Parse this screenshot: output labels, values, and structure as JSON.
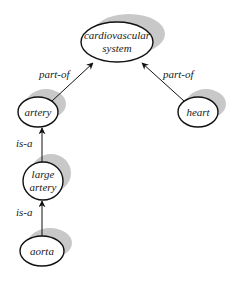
{
  "diagram": {
    "type": "concept-graph",
    "colors": {
      "stroke": "#111111",
      "shadow": "#c8c8c8",
      "fill": "#ffffff",
      "text": "#1a1a1a"
    },
    "nodes": [
      {
        "id": "cardiovascular-system",
        "lines": [
          "cardiovascular",
          "system"
        ]
      },
      {
        "id": "artery",
        "lines": [
          "artery"
        ]
      },
      {
        "id": "heart",
        "lines": [
          "heart"
        ]
      },
      {
        "id": "large-artery",
        "lines": [
          "large",
          "artery"
        ]
      },
      {
        "id": "aorta",
        "lines": [
          "aorta"
        ]
      }
    ],
    "edges": [
      {
        "from": "artery",
        "to": "cardiovascular-system",
        "label": "part-of"
      },
      {
        "from": "heart",
        "to": "cardiovascular-system",
        "label": "part-of"
      },
      {
        "from": "large-artery",
        "to": "artery",
        "label": "is-a"
      },
      {
        "from": "aorta",
        "to": "large-artery",
        "label": "is-a"
      }
    ]
  }
}
